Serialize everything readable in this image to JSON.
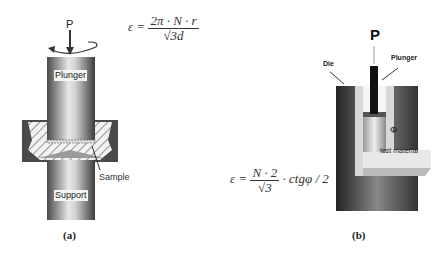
{
  "figure_a": {
    "force_label": "P",
    "plunger_label": "Plunger",
    "sample_label": "Sample",
    "support_label": "Support",
    "caption": "(a)",
    "equation": {
      "lhs": "ε =",
      "numerator": "2π · N · r",
      "denominator": "√3d"
    }
  },
  "figure_b": {
    "force_label": "P",
    "plunger_label": "Plunger",
    "die_label": "Die",
    "angle_label": "Φ",
    "material_label": "test material",
    "caption": "(b)",
    "equation": {
      "lhs": "ε =",
      "numerator": "N · 2",
      "denominator": "√3",
      "suffix": "· ctgφ / 2"
    }
  }
}
